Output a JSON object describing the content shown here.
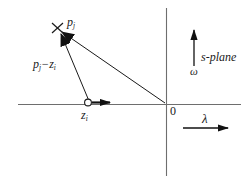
{
  "figure": {
    "background_color": "#ffffff",
    "line_color": "#1a1a1a",
    "width": 248,
    "height": 181
  },
  "axes": {
    "real_axis": {
      "name": "lambda-axis",
      "label": "λ",
      "orientation": "horizontal",
      "y": 104,
      "x_start": 18,
      "x_end": 241
    },
    "imaginary_axis": {
      "name": "omega-axis",
      "label": "ω",
      "orientation": "vertical",
      "x": 166,
      "y_start": 8,
      "y_end": 176
    },
    "origin_label": "0",
    "plane_label": "s-plane"
  },
  "markers": {
    "pole": {
      "symbol": "x",
      "label_base": "p",
      "label_sub": "j",
      "label": "pⱼ",
      "x": 57,
      "y": 28
    },
    "zero": {
      "symbol": "o",
      "label_base": "z",
      "label_sub": "i",
      "label": "zᵢ",
      "x": 88,
      "y": 104
    }
  },
  "vectors": {
    "difference": {
      "label_base": "p",
      "label_sub1": "j",
      "label_op": "−",
      "label_base2": "z",
      "label_sub2": "i",
      "label": "pⱼ − zᵢ",
      "from": "zero",
      "to": "pole"
    },
    "from_origin": {
      "label": "",
      "from": "origin",
      "to": "pole"
    },
    "zero_marker_arrow": {
      "label": "",
      "from": "zero",
      "direction": "right"
    }
  },
  "arrow_labels": {
    "omega_arrow": "ω",
    "lambda_arrow": "λ",
    "plane": "s-plane",
    "origin": "0"
  }
}
